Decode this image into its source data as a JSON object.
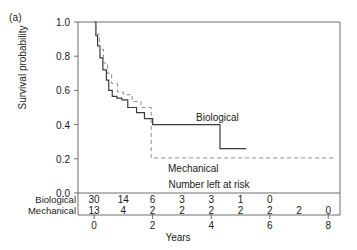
{
  "panel_label": "(a)",
  "chart_data": {
    "type": "line",
    "title": "",
    "xlabel": "Years",
    "ylabel": "Survival probability",
    "xlim": [
      -0.55,
      8.4
    ],
    "ylim": [
      0.0,
      1.0
    ],
    "xticks": [
      0,
      2,
      4,
      6,
      8
    ],
    "xtick_labels": [
      "0",
      "2",
      "4",
      "6",
      "8"
    ],
    "yticks": [
      0.0,
      0.2,
      0.4,
      0.6,
      0.8,
      1.0
    ],
    "ytick_labels": [
      "0.0",
      "0.2",
      "0.4",
      "0.6",
      "0.8",
      "1.0"
    ],
    "grid": false,
    "legend_position": "inline-annotation",
    "series": [
      {
        "name": "Biological",
        "style": "solid",
        "color": "#3b3b3b",
        "annotation": "Biological",
        "x": [
          0.0,
          0.06,
          0.06,
          0.12,
          0.12,
          0.2,
          0.2,
          0.3,
          0.3,
          0.42,
          0.42,
          0.5,
          0.5,
          0.62,
          0.62,
          0.78,
          0.78,
          0.95,
          0.95,
          1.15,
          1.15,
          1.45,
          1.45,
          1.72,
          1.72,
          2.0,
          2.0,
          4.3,
          4.3,
          5.2
        ],
        "y": [
          1.0,
          1.0,
          0.92,
          0.92,
          0.86,
          0.86,
          0.79,
          0.79,
          0.72,
          0.72,
          0.66,
          0.66,
          0.6,
          0.6,
          0.565,
          0.565,
          0.555,
          0.555,
          0.545,
          0.545,
          0.5,
          0.5,
          0.47,
          0.47,
          0.435,
          0.435,
          0.4,
          0.4,
          0.26,
          0.26
        ]
      },
      {
        "name": "Mechanical",
        "style": "dashed",
        "color": "#8c8c8c",
        "annotation": "Mechanical",
        "x": [
          0.0,
          0.08,
          0.08,
          0.18,
          0.18,
          0.32,
          0.32,
          0.46,
          0.46,
          0.6,
          0.6,
          0.8,
          0.8,
          1.0,
          1.0,
          1.3,
          1.3,
          1.6,
          1.6,
          1.95,
          1.95,
          8.25
        ],
        "y": [
          1.0,
          1.0,
          0.93,
          0.93,
          0.84,
          0.84,
          0.76,
          0.76,
          0.7,
          0.7,
          0.64,
          0.64,
          0.59,
          0.59,
          0.575,
          0.575,
          0.535,
          0.535,
          0.5,
          0.5,
          0.205,
          0.205
        ]
      }
    ]
  },
  "risk_table": {
    "title": "Number left at risk",
    "rows": [
      {
        "label": "Biological",
        "values": [
          "30",
          "14",
          "6",
          "3",
          "3",
          "1",
          "0"
        ],
        "positions": [
          0,
          1,
          2,
          3,
          4,
          5,
          6
        ]
      },
      {
        "label": "Mechanical",
        "values": [
          "13",
          "4",
          "2",
          "2",
          "2",
          "2",
          "2",
          "2",
          "0"
        ],
        "positions": [
          0,
          1,
          2,
          3,
          4,
          5,
          6,
          7,
          8
        ]
      }
    ]
  }
}
